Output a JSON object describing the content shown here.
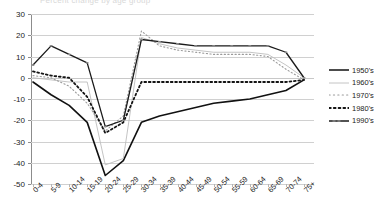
{
  "title_strip": "Percent change by age group",
  "legend": {
    "position": "right",
    "entries": [
      {
        "label": "1950's",
        "key": "s1950"
      },
      {
        "label": "1960's",
        "key": "s1960"
      },
      {
        "label": "1970's",
        "key": "s1970"
      },
      {
        "label": "1980's",
        "key": "s1980"
      },
      {
        "label": "1990's",
        "key": "s1990"
      }
    ]
  },
  "axis": {
    "y_ticks": [
      "30",
      "20",
      "10",
      "0",
      "-10",
      "-20",
      "-30",
      "-40",
      "-50"
    ],
    "x_ticks": [
      "0-4",
      "5-9",
      "10-14",
      "15-19",
      "20-24",
      "25-29",
      "30-34",
      "35-39",
      "40-44",
      "45-49",
      "50-54",
      "55-59",
      "60-64",
      "65-69",
      "70-74",
      "75+"
    ]
  },
  "chart_data": {
    "type": "line",
    "title": "Percent change by age group",
    "xlabel": "",
    "ylabel": "",
    "ylim": [
      -50,
      30
    ],
    "ytick_values": [
      30,
      20,
      10,
      0,
      -10,
      -20,
      -30,
      -40,
      -50
    ],
    "grid": true,
    "legend_position": "right",
    "categories": [
      "0-4",
      "5-9",
      "10-14",
      "15-19",
      "20-24",
      "25-29",
      "30-34",
      "35-39",
      "40-44",
      "45-49",
      "50-54",
      "55-59",
      "60-64",
      "65-69",
      "70-74",
      "75+"
    ],
    "series": [
      {
        "name": "1950's",
        "key": "s1950",
        "style": "solid",
        "color": "#111111",
        "width": 1.6,
        "values": [
          -2,
          -8,
          -13,
          -21,
          -46,
          -39,
          -21,
          -18,
          -16,
          -14,
          -12,
          -11,
          -10,
          -8,
          -6,
          -1
        ]
      },
      {
        "name": "1960's",
        "key": "s1960",
        "style": "solid",
        "color": "#bdbdbd",
        "width": 0.9,
        "values": [
          0,
          -1,
          -2,
          -2,
          -41,
          -38,
          19,
          16,
          14,
          13,
          12,
          12,
          12,
          11,
          6,
          0
        ]
      },
      {
        "name": "1970's",
        "key": "s1970",
        "style": "fine-dotted",
        "color": "#9a9a9a",
        "width": 1.1,
        "values": [
          1,
          0,
          -4,
          -12,
          -25,
          -18,
          22,
          15,
          13,
          12,
          11,
          11,
          11,
          10,
          4,
          -1
        ]
      },
      {
        "name": "1980's",
        "key": "s1980",
        "style": "bold-dotted",
        "color": "#141414",
        "width": 1.8,
        "values": [
          3,
          1,
          0,
          -9,
          -26,
          -21,
          -2,
          -2,
          -2,
          -2,
          -2,
          -2,
          -2,
          -2,
          -2,
          -1
        ]
      },
      {
        "name": "1990's",
        "key": "s1990",
        "style": "solid-marked",
        "color": "#1a1a1a",
        "width": 1.3,
        "values": [
          6,
          15,
          11,
          7,
          -23,
          -20,
          18,
          17,
          16,
          15,
          15,
          15,
          15,
          15,
          12,
          0
        ]
      }
    ]
  }
}
